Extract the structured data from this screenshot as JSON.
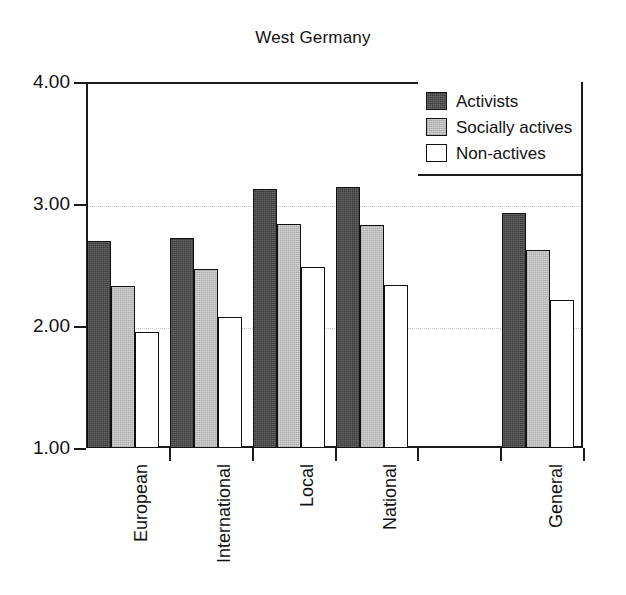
{
  "chart_data": {
    "type": "bar",
    "title": "West Germany",
    "xlabel": "",
    "ylabel": "",
    "ylim": [
      1.0,
      4.0
    ],
    "yticks": [
      "1.00",
      "2.00",
      "3.00",
      "4.00"
    ],
    "ytick_values": [
      1.0,
      2.0,
      3.0,
      4.0
    ],
    "grid": "horizontal-dotted",
    "legend_position": "top-right",
    "categories": [
      "European",
      "International",
      "Local",
      "National",
      "",
      "General"
    ],
    "series": [
      {
        "name": "Activists",
        "color": "#3a3a3a",
        "values": [
          2.7,
          2.72,
          3.12,
          3.14,
          null,
          2.93
        ]
      },
      {
        "name": "Socially actives",
        "color": "#d2d2d2",
        "values": [
          2.33,
          2.47,
          2.84,
          2.83,
          null,
          2.62
        ]
      },
      {
        "name": "Non-actives",
        "color": "#ffffff",
        "values": [
          1.95,
          2.07,
          2.48,
          2.34,
          null,
          2.21
        ]
      }
    ]
  },
  "figure": {
    "background": "#ffffff",
    "axis_color": "#1a1a1a",
    "gridline_color": "#c9c9c9"
  }
}
